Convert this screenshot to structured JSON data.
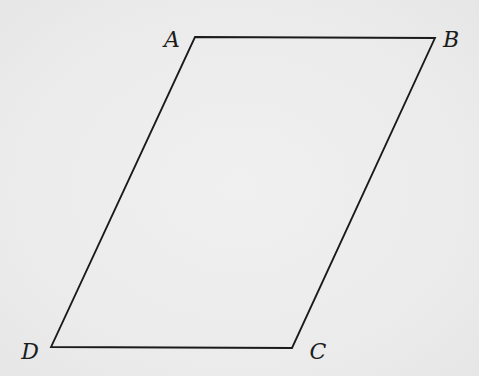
{
  "diagram": {
    "type": "parallelogram",
    "stroke_color": "#1a1a1a",
    "background_color": "#ececec",
    "vertices": [
      {
        "id": "A",
        "label": "A",
        "x": 195,
        "y": 37,
        "label_x": 172,
        "label_y": 40
      },
      {
        "id": "B",
        "label": "B",
        "x": 435,
        "y": 38,
        "label_x": 451,
        "label_y": 40
      },
      {
        "id": "C",
        "label": "C",
        "x": 292,
        "y": 348,
        "label_x": 318,
        "label_y": 352
      },
      {
        "id": "D",
        "label": "D",
        "x": 51,
        "y": 347,
        "label_x": 30,
        "label_y": 352
      }
    ],
    "edges": [
      {
        "from": "A",
        "to": "B"
      },
      {
        "from": "B",
        "to": "C"
      },
      {
        "from": "C",
        "to": "D"
      },
      {
        "from": "D",
        "to": "A"
      }
    ]
  }
}
